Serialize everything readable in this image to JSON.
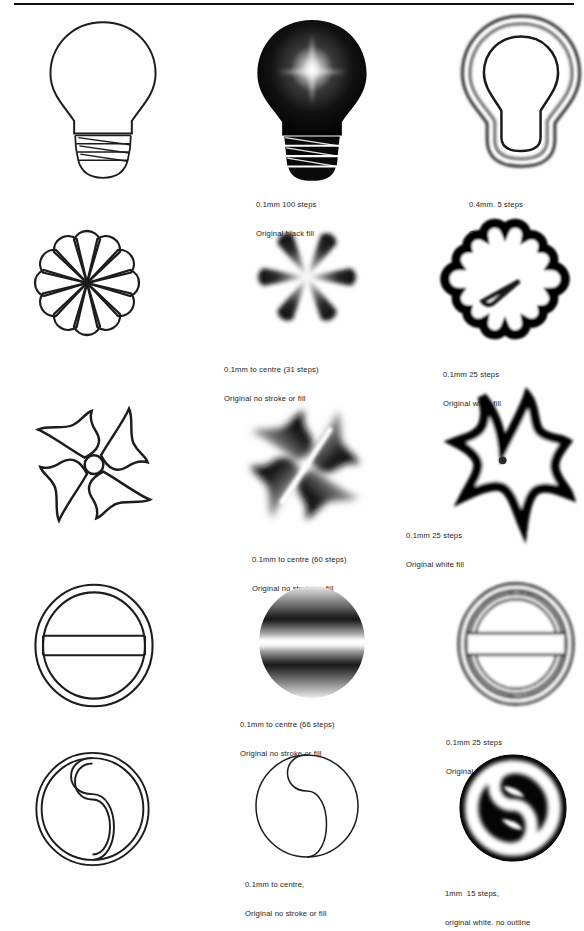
{
  "page": {
    "background_color": "#ffffff",
    "ink_color": "#1b1b1b",
    "rule_color": "#111111"
  },
  "columns": [
    {
      "name": "original-outline",
      "label": "Original outline artwork"
    },
    {
      "name": "blend-to-centre",
      "label": "Blend to centre"
    },
    {
      "name": "blend-outward",
      "label": "Blend outward"
    }
  ],
  "rows": [
    {
      "name": "lightbulb",
      "shape": "light-bulb",
      "cells": [
        {
          "column": "original-outline",
          "render": "outline",
          "caption": []
        },
        {
          "column": "blend-to-centre",
          "render": "gradient-black-fill",
          "caption": [
            "0.1mm 100 steps",
            "Original black fill"
          ]
        },
        {
          "column": "blend-outward",
          "render": "gradient-white-fill",
          "caption": [
            "0.4mm. 5 steps",
            "Original white fill"
          ]
        }
      ]
    },
    {
      "name": "rosette",
      "shape": "twelve-petal-flower",
      "cells": [
        {
          "column": "original-outline",
          "render": "outline",
          "caption": []
        },
        {
          "column": "blend-to-centre",
          "render": "gradient-spikes",
          "caption": [
            "0.1mm to centre (31 steps)",
            "Original no stroke or fill"
          ]
        },
        {
          "column": "blend-outward",
          "render": "gradient-white-fill",
          "caption": [
            "0.1mm 25 steps",
            "Original white fill"
          ]
        }
      ]
    },
    {
      "name": "pinwheel",
      "shape": "four-blade-pinwheel",
      "cells": [
        {
          "column": "original-outline",
          "render": "outline",
          "caption": []
        },
        {
          "column": "blend-to-centre",
          "render": "gradient-blades",
          "caption": [
            "0.1mm to centre (60 steps)",
            "Original no stroke or fill"
          ]
        },
        {
          "column": "blend-outward",
          "render": "gradient-white-fill",
          "caption": [
            "0.1mm 25 steps",
            "Original white fill"
          ]
        }
      ]
    },
    {
      "name": "barred-circle",
      "shape": "circle-with-horizontal-bar",
      "cells": [
        {
          "column": "original-outline",
          "render": "outline",
          "caption": []
        },
        {
          "column": "blend-to-centre",
          "render": "gradient-bar",
          "caption": [
            "0.1mm to centre (66 steps)",
            "Original no stroke or fill"
          ]
        },
        {
          "column": "blend-outward",
          "render": "gradient-white-fill",
          "caption": [
            "0.1mm 25 steps",
            "Original white fill"
          ]
        }
      ]
    },
    {
      "name": "yin-yang",
      "shape": "yin-yang",
      "cells": [
        {
          "column": "original-outline",
          "render": "outline",
          "caption": []
        },
        {
          "column": "blend-to-centre",
          "render": "outline-thin",
          "caption": [
            "0.1mm to centre,",
            "Original no stroke or fill"
          ]
        },
        {
          "column": "blend-outward",
          "render": "gradient-white-no-outline",
          "caption": [
            "1mm  15 steps,",
            "original white. no outline"
          ]
        }
      ]
    }
  ]
}
